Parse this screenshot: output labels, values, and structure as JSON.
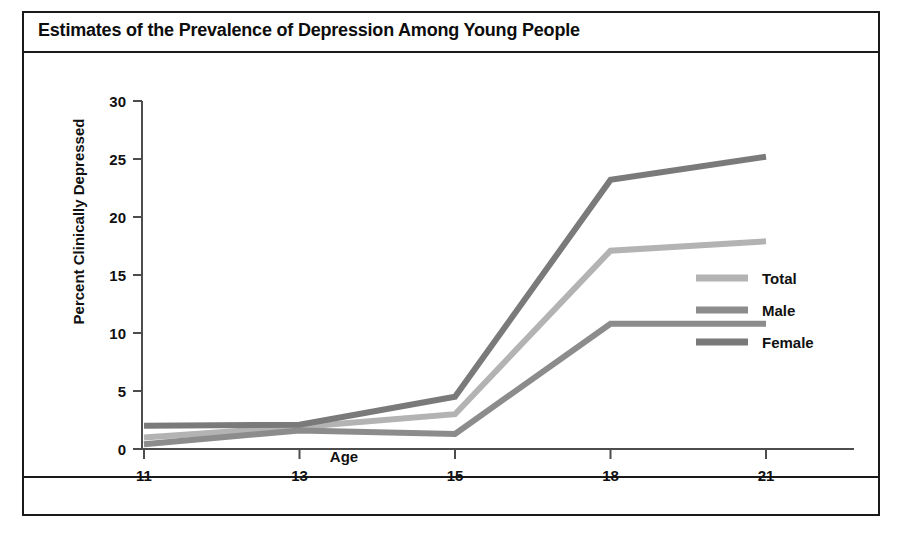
{
  "chart_data": {
    "type": "line",
    "title": "Estimates of the Prevalence of Depression Among Young People",
    "xlabel": "Age",
    "ylabel": "Percent Clinically Depressed",
    "categories": [
      "11",
      "13",
      "15",
      "18",
      "21"
    ],
    "x": [
      11,
      13,
      15,
      18,
      21
    ],
    "ylim": [
      0,
      30
    ],
    "yticks": [
      "0",
      "5",
      "10",
      "15",
      "20",
      "25",
      "30"
    ],
    "ytick_values": [
      0,
      5,
      10,
      15,
      20,
      25,
      30
    ],
    "grid": false,
    "legend_position": "right",
    "series": [
      {
        "name": "Total",
        "color": "#b3b3b3",
        "values": [
          1.0,
          1.9,
          3.0,
          17.1,
          17.9
        ]
      },
      {
        "name": "Male",
        "color": "#8c8c8c",
        "values": [
          0.4,
          1.6,
          1.3,
          10.8,
          10.8
        ]
      },
      {
        "name": "Female",
        "color": "#7a7a7a",
        "values": [
          2.0,
          2.1,
          4.5,
          23.2,
          25.2
        ]
      }
    ]
  },
  "legend": {
    "items": [
      {
        "label": "Total",
        "color": "#b3b3b3"
      },
      {
        "label": "Male",
        "color": "#8c8c8c"
      },
      {
        "label": "Female",
        "color": "#7a7a7a"
      }
    ]
  },
  "axis": {
    "line_color": "#4d4d4d",
    "tick_color": "#4d4d4d"
  },
  "frame": {
    "border_color": "#1a1a1a"
  }
}
